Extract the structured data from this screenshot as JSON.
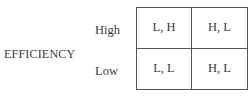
{
  "axis": {
    "label": "EFFICIENCY"
  },
  "rows": [
    {
      "label": "High",
      "cells": [
        "L, H",
        "H, L"
      ]
    },
    {
      "label": "Low",
      "cells": [
        "L, L",
        "H, L"
      ]
    }
  ]
}
